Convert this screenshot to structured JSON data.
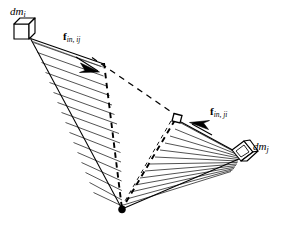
{
  "figure": {
    "background_color": "#ffffff",
    "line_color": "#000000",
    "hatch_color": "#000000",
    "width": 284,
    "height": 232
  },
  "labels": {
    "mass_i": {
      "symbol": "dm",
      "subscript": "i",
      "text": "dm_i"
    },
    "mass_j": {
      "symbol": "dm",
      "subscript": "j",
      "text": "dm_j"
    },
    "force_ij": {
      "symbol": "f",
      "subscript": "in, ij",
      "text": "f_in, ij"
    },
    "force_ji": {
      "symbol": "f",
      "subscript": "in, ji",
      "text": "f_in, ji"
    }
  },
  "geometry": {
    "origin_point": {
      "x": 122,
      "y": 209,
      "name": "common-vertex"
    },
    "mass_i_cube": {
      "x": 22,
      "y": 31,
      "size": 17
    },
    "mass_j_cube": {
      "x": 245,
      "y": 152,
      "size": 17
    },
    "mid_square": {
      "x": 176,
      "y": 118,
      "size": 8
    },
    "arrow_ij_tip": {
      "x": 97,
      "y": 70
    },
    "arrow_ji_tip": {
      "x": 190,
      "y": 124
    },
    "left_fan": {
      "apex": {
        "x": 30,
        "y": 38
      },
      "edge_a": {
        "x": 122,
        "y": 209
      },
      "edge_b": {
        "x": 104,
        "y": 67
      },
      "hatch_count": 14,
      "hatch_direction": "near-horizontal"
    },
    "right_fan": {
      "apex": {
        "x": 240,
        "y": 157
      },
      "edge_a": {
        "x": 122,
        "y": 209
      },
      "edge_b": {
        "x": 176,
        "y": 118
      },
      "hatch_count": 12,
      "hatch_direction": "radial-diagonal"
    },
    "dashed_paths": [
      {
        "name": "ij-dashed-edge",
        "from": {
          "x": 104,
          "y": 64
        },
        "to": {
          "x": 122,
          "y": 209
        }
      },
      {
        "name": "ji-dashed-edge",
        "from": {
          "x": 176,
          "y": 118
        },
        "to": {
          "x": 122,
          "y": 209
        }
      },
      {
        "name": "top-dashed-connector",
        "from": {
          "x": 93,
          "y": 58
        },
        "to": {
          "x": 176,
          "y": 116
        }
      }
    ]
  }
}
